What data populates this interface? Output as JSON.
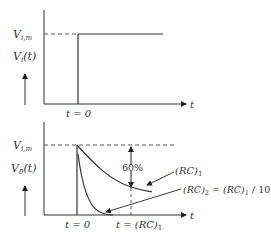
{
  "top_plot": {
    "y_level_label_main": "V",
    "y_level_label_sub": "i,m",
    "y_axis_label_main": "V",
    "y_axis_label_sub": "i",
    "y_axis_label_arg": "(t)",
    "x_tick_label": "t = 0",
    "x_axis_label": "t"
  },
  "bottom_plot": {
    "y_level_label_main": "V",
    "y_level_label_sub": "i,m",
    "y_axis_label_main": "V",
    "y_axis_label_sub": "0",
    "y_axis_label_arg": "(t)",
    "x_tick_label_0": "t = 0",
    "x_tick_label_rc_main": "t = (RC)",
    "x_tick_label_rc_sub": "1",
    "x_axis_label": "t",
    "percent_annotation": "60%",
    "curve1_label_main": "(RC)",
    "curve1_label_sub": "1",
    "curve2_label_a": "(RC)",
    "curve2_label_a_sub": "2",
    "curve2_label_b": " = (RC)",
    "curve2_label_b_sub": "1",
    "curve2_label_c": " / 10"
  },
  "colors": {
    "line": "#333333",
    "dash": "#444444"
  }
}
